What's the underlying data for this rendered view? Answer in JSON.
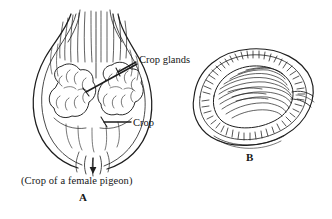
{
  "figure": {
    "domain": "scientific-line-drawing",
    "background_color": "#ffffff",
    "ink_color": "#1a1a1a",
    "width": 332,
    "height": 219,
    "labels": {
      "crop_glands": "Crop glands",
      "crop": "Crop",
      "caption": "(Crop  of a female pigeon)",
      "panel_a": "A",
      "panel_b": "B"
    },
    "panels": [
      {
        "id": "A",
        "name": "crop-of-female-pigeon",
        "label": "A",
        "description": "Whole crop of a female pigeon, pear/heart shaped, with esophagus entering at top and narrowing at the bottom; two lobed glandular masses shown inside.",
        "annotations": [
          "Crop glands",
          "Crop"
        ]
      },
      {
        "id": "B",
        "name": "crop-cross-section",
        "label": "B",
        "description": "Cut-open crop showing the thickened hatched wall rim and the fibrous, folded inner lining.",
        "annotations": []
      }
    ]
  }
}
